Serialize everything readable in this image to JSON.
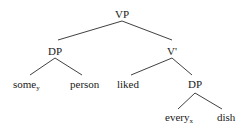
{
  "tree": {
    "root": {
      "label": "VP"
    },
    "nodes": {
      "vp": {
        "label": "VP"
      },
      "dp_subject": {
        "label": "DP"
      },
      "some": {
        "label": "some",
        "subscript": "y"
      },
      "person": {
        "label": "person"
      },
      "v_bar": {
        "label": "V'"
      },
      "liked": {
        "label": "liked"
      },
      "dp_object": {
        "label": "DP"
      },
      "every": {
        "label": "every",
        "subscript": "x"
      },
      "dish": {
        "label": "dish"
      }
    },
    "edges": [
      [
        "VP",
        "DP"
      ],
      [
        "VP",
        "V'"
      ],
      [
        "DP",
        "some_y"
      ],
      [
        "DP",
        "person"
      ],
      [
        "V'",
        "liked"
      ],
      [
        "V'",
        "DP"
      ],
      [
        "DP",
        "every_x"
      ],
      [
        "DP",
        "dish"
      ]
    ]
  }
}
